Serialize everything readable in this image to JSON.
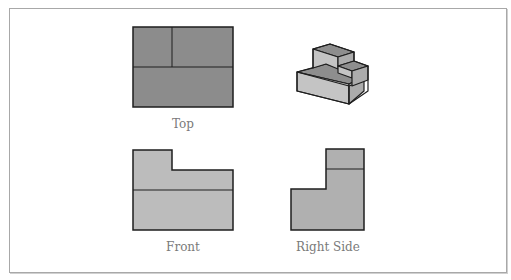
{
  "figure": {
    "views": [
      {
        "id": "top",
        "label": "Top"
      },
      {
        "id": "isometric",
        "label": ""
      },
      {
        "id": "front",
        "label": "Front"
      },
      {
        "id": "right-side",
        "label": "Right Side"
      }
    ],
    "colors": {
      "top_fill": "#8c8c8c",
      "front_fill": "#bcbcbc",
      "side_fill": "#b0b0b0",
      "iso_top_fill": "#8e8e8e",
      "iso_front_fill": "#c4c4c4",
      "iso_side_fill": "#acacac",
      "stroke": "#1e1e1e",
      "frame_border": "#a8a8a8",
      "label_color": "#7a7a7a"
    }
  }
}
